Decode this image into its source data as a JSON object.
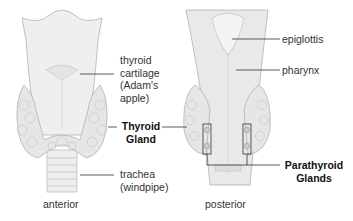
{
  "diagram": {
    "anterior_view": {
      "caption": "anterior",
      "labels": {
        "thyroid_cartilage": "thyroid\ncartilage\n(Adam's\napple)",
        "thyroid_gland": "Thyroid\nGland",
        "trachea": "trachea\n(windpipe)"
      }
    },
    "posterior_view": {
      "caption": "posterior",
      "labels": {
        "epiglottis": "epiglottis",
        "pharynx": "pharynx",
        "parathyroid_glands": "Parathyroid\nGlands"
      }
    },
    "colors": {
      "tissue": "#eeeeee",
      "tissue_shade": "#d6d6d6",
      "outline": "#9a9a9a",
      "label_line": "#333333"
    }
  }
}
